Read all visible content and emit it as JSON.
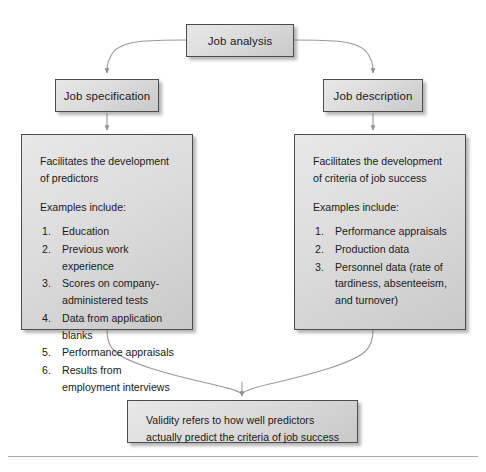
{
  "diagram": {
    "nodes": {
      "root": {
        "label": "Job analysis"
      },
      "left_label": {
        "label": "Job specification"
      },
      "right_label": {
        "label": "Job description"
      },
      "left_panel": {
        "heading": "Facilitates the development of predictors",
        "subheading": "Examples include:",
        "items": [
          {
            "num": "1.",
            "text": "Education"
          },
          {
            "num": "2.",
            "text": "Previous work experience"
          },
          {
            "num": "3.",
            "text": "Scores on company-administered tests"
          },
          {
            "num": "4.",
            "text": "Data from application blanks"
          },
          {
            "num": "5.",
            "text": "Performance appraisals"
          },
          {
            "num": "6.",
            "text": "Results from employment interviews"
          }
        ]
      },
      "right_panel": {
        "heading": "Facilitates the development of criteria of job success",
        "subheading": "Examples include:",
        "items": [
          {
            "num": "1.",
            "text": "Performance appraisals"
          },
          {
            "num": "2.",
            "text": "Production data"
          },
          {
            "num": "3.",
            "text": "Personnel data (rate of tardiness, absenteeism, and turnover)"
          }
        ]
      },
      "conclusion": {
        "text": "Validity refers to how well predictors actually predict the criteria of job success"
      }
    },
    "edges": [
      {
        "name": "root-to-job-specification",
        "from": "root",
        "to": "left_label",
        "style": "curved-arrow"
      },
      {
        "name": "root-to-job-description",
        "from": "root",
        "to": "right_label",
        "style": "curved-arrow"
      },
      {
        "name": "job-specification-to-left-panel",
        "from": "left_label",
        "to": "left_panel",
        "style": "straight-arrow"
      },
      {
        "name": "job-description-to-right-panel",
        "from": "right_label",
        "to": "right_panel",
        "style": "straight-arrow"
      },
      {
        "name": "left-panel-to-conclusion",
        "from": "left_panel",
        "to": "conclusion",
        "style": "curved-arrow"
      },
      {
        "name": "right-panel-to-conclusion",
        "from": "right_panel",
        "to": "conclusion",
        "style": "curved-arrow"
      }
    ],
    "colors": {
      "box_border": "#4c4c4c",
      "box_fill_light": "#e8e8e8",
      "box_fill_dark": "#c9c9c9",
      "connector": "#9a9a9a",
      "text": "#1a1a1a",
      "rule": "#a9a9a9"
    },
    "top_sliver_text": ""
  }
}
